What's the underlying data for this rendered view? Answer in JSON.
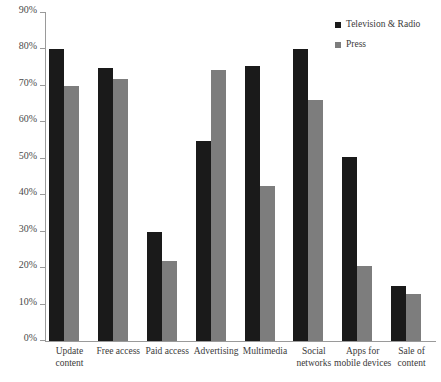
{
  "chart_data": {
    "type": "bar",
    "title": "",
    "xlabel": "",
    "ylabel": "",
    "ylim": [
      0,
      90
    ],
    "ytick_labels": [
      "0%",
      "10%",
      "20%",
      "30%",
      "40%",
      "50%",
      "60%",
      "70%",
      "80%",
      "90%"
    ],
    "ytick_values": [
      0,
      10,
      20,
      30,
      40,
      50,
      60,
      70,
      80,
      90
    ],
    "grid": false,
    "legend_position": "top-right",
    "categories": [
      "Update\ncontent",
      "Free access",
      "Paid access",
      "Advertising",
      "Multimedia",
      "Social\nnetworks",
      "Apps for\nmobile devices",
      "Sale of\ncontent"
    ],
    "series": [
      {
        "name": "Television & Radio",
        "color": "#1a1a1a",
        "values": [
          80,
          75,
          30,
          55,
          75.5,
          80,
          50.5,
          15
        ]
      },
      {
        "name": "Press",
        "color": "#7d7d7d",
        "values": [
          70,
          72,
          22,
          74.5,
          42.5,
          66,
          20.5,
          13
        ]
      }
    ]
  }
}
